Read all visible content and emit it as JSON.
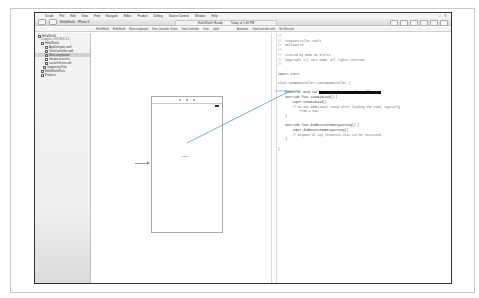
{
  "menubar": {
    "apple": "",
    "items": [
      "Xcode",
      "File",
      "Edit",
      "View",
      "Find",
      "Navigate",
      "Editor",
      "Product",
      "Debug",
      "Source Control",
      "Window",
      "Help"
    ]
  },
  "toolbar": {
    "scheme": "HelloWorld",
    "destination": "iPhone 6",
    "activity_status": "HelloWorld: Ready",
    "activity_time": "Today at 1:46 PM"
  },
  "jumpbar": {
    "left": [
      "HelloWorld",
      "HelloWorld",
      "Main.storyboard",
      "View Controller Scene",
      "View Controller",
      "View",
      "Label"
    ],
    "right": [
      "Automatic",
      "ViewController.swift",
      "No Selection"
    ]
  },
  "navigator": {
    "items": [
      {
        "label": "HelloWorld",
        "sub": "2 targets, iOS SDK 8.1",
        "level": 0
      },
      {
        "label": "HelloWorld",
        "level": 1
      },
      {
        "label": "AppDelegate.swift",
        "level": 2
      },
      {
        "label": "ViewController.swift",
        "level": 2
      },
      {
        "label": "Main.storyboard",
        "level": 2,
        "selected": true
      },
      {
        "label": "Images.xcassets",
        "level": 2
      },
      {
        "label": "LaunchScreen.xib",
        "level": 2
      },
      {
        "label": "Supporting Files",
        "level": 2
      },
      {
        "label": "HelloWorldTests",
        "level": 1
      },
      {
        "label": "Products",
        "level": 1
      }
    ]
  },
  "storyboard": {
    "label_text": "Label"
  },
  "editor": {
    "filename": "ViewController.swift",
    "lines": [
      "//",
      "//  ViewController.swift",
      "//  HelloWorld",
      "//",
      "//  Created by Demo on 8/3/14.",
      "//  Copyright (c) 2014 Demo. All rights reserved.",
      "//",
      "",
      "import UIKit",
      "",
      "class ViewController: UIViewController {",
      "",
      "    @IBOutlet weak var",
      "    override func viewDidLoad() {",
      "        super.viewDidLoad()",
      "        // Do any additional setup after loading the view, typically",
      "            from a nib.",
      "    }",
      "",
      "    override func didReceiveMemoryWarning() {",
      "        super.didReceiveMemoryWarning()",
      "        // Dispose of any resources that can be recreated.",
      "    }",
      "",
      "}"
    ],
    "insert_tooltip": "Insert Outlet or Outlet Collection"
  }
}
